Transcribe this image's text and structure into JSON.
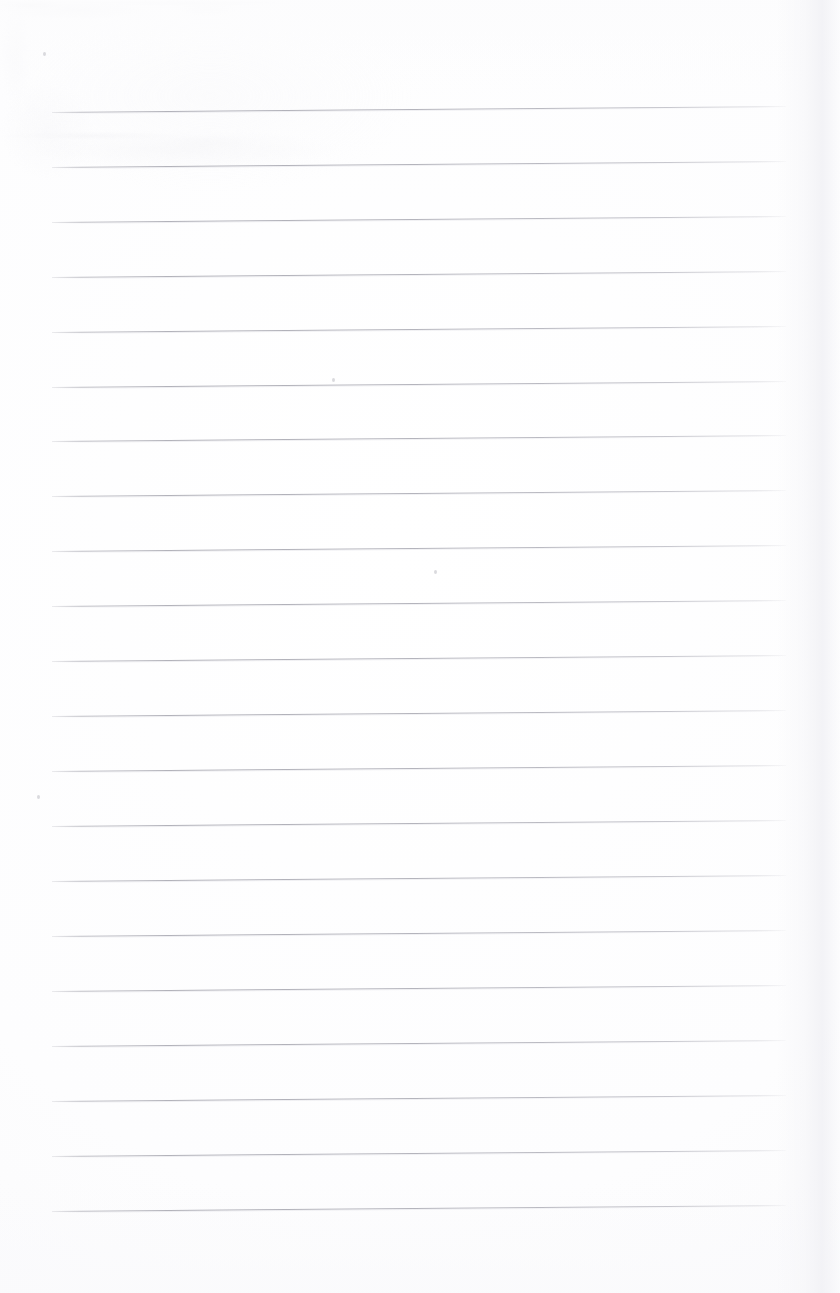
{
  "document": {
    "kind": "lined-notebook-page-scan",
    "title": "Blank lined notebook page",
    "page_width": 840,
    "page_height": 1293,
    "background_color": "#fdfdfd",
    "has_text_content": false,
    "visible_text": "",
    "handwriting_present": false,
    "margin_rule_present": false,
    "header_present": false,
    "footer_present": false,
    "page_number": ""
  },
  "ruling": {
    "line_color": "#b4b4bc",
    "line_thickness_px": 1,
    "line_count": 21,
    "first_line_y": 112,
    "line_spacing_px": 54.9,
    "left_x": 52,
    "right_x": 786,
    "line_length_px": 734,
    "skew_rise_px": 6,
    "skew_degrees": -0.47,
    "lines": [
      {
        "index": 1,
        "y_left": 112,
        "y_right": 106
      },
      {
        "index": 2,
        "y_left": 167,
        "y_right": 161
      },
      {
        "index": 3,
        "y_left": 222,
        "y_right": 216
      },
      {
        "index": 4,
        "y_left": 277,
        "y_right": 271
      },
      {
        "index": 5,
        "y_left": 332,
        "y_right": 326
      },
      {
        "index": 6,
        "y_left": 387,
        "y_right": 381
      },
      {
        "index": 7,
        "y_left": 441,
        "y_right": 435
      },
      {
        "index": 8,
        "y_left": 496,
        "y_right": 490
      },
      {
        "index": 9,
        "y_left": 551,
        "y_right": 545
      },
      {
        "index": 10,
        "y_left": 606,
        "y_right": 600
      },
      {
        "index": 11,
        "y_left": 661,
        "y_right": 655
      },
      {
        "index": 12,
        "y_left": 716,
        "y_right": 710
      },
      {
        "index": 13,
        "y_left": 771,
        "y_right": 765
      },
      {
        "index": 14,
        "y_left": 826,
        "y_right": 820
      },
      {
        "index": 15,
        "y_left": 881,
        "y_right": 875
      },
      {
        "index": 16,
        "y_left": 936,
        "y_right": 930
      },
      {
        "index": 17,
        "y_left": 991,
        "y_right": 985
      },
      {
        "index": 18,
        "y_left": 1046,
        "y_right": 1040
      },
      {
        "index": 19,
        "y_left": 1101,
        "y_right": 1095
      },
      {
        "index": 20,
        "y_left": 1156,
        "y_right": 1150
      },
      {
        "index": 21,
        "y_left": 1211,
        "y_right": 1205
      }
    ]
  },
  "artifacts": {
    "specks": [
      {
        "name": "scan-speck-center",
        "x": 434,
        "y": 570
      },
      {
        "name": "scan-speck-upper-left",
        "x": 43,
        "y": 52
      },
      {
        "name": "scan-speck-upper-mid",
        "x": 332,
        "y": 378
      },
      {
        "name": "scan-speck-left-mid",
        "x": 37,
        "y": 795
      }
    ],
    "edge_shadow": {
      "name": "right-page-edge-shadow",
      "x": 815,
      "description": "faint vertical tonal band from scanned page edge"
    }
  },
  "regions": {
    "top_margin_label": "top margin",
    "bottom_margin_label": "bottom margin",
    "left_margin_label": "left margin",
    "right_margin_label": "right margin",
    "writing_area_label": "writing area"
  }
}
